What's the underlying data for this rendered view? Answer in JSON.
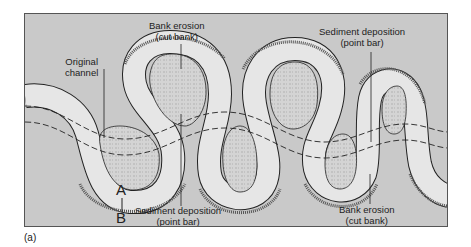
{
  "figure": {
    "panel_label": "(a)",
    "labels": {
      "original_channel": {
        "line1": "Original",
        "line2": "channel"
      },
      "bank_erosion_top": {
        "line1": "Bank erosion",
        "line2": "(cut bank)"
      },
      "sediment_deposition_top": {
        "line1": "Sediment deposition",
        "line2": "(point bar)"
      },
      "sediment_deposition_bottom": {
        "line1": "Sediment deposition",
        "line2": "(point bar)"
      },
      "bank_erosion_bottom": {
        "line1": "Bank erosion",
        "line2": "(cut bank)"
      },
      "point_a": "A",
      "point_b": "B"
    },
    "colors": {
      "background": "#c9c9c9",
      "channel": "#e6e6e6",
      "point_bar": "#d6d6d6",
      "outline": "#222222",
      "frame": "#555555"
    }
  }
}
